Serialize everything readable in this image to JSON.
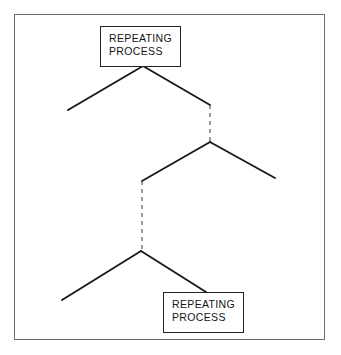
{
  "figure": {
    "type": "zigzag-process-diagram",
    "border_color": "#6e6e6e",
    "line_color": "#1a1a1a",
    "background": "#ffffff"
  },
  "boxes": [
    {
      "id": "top",
      "name": "repeating-process-top",
      "line1": "REPEATING",
      "line2": "PROCESS"
    },
    {
      "id": "bottom",
      "name": "repeating-process-bottom",
      "line1": "REPEATING",
      "line2": "PROCESS"
    }
  ],
  "segments": {
    "solid": [
      {
        "name": "top-left-branch",
        "x1": 143,
        "y1": 66,
        "x2": 68,
        "y2": 110
      },
      {
        "name": "top-right-branch",
        "x1": 143,
        "y1": 66,
        "x2": 210,
        "y2": 105
      },
      {
        "name": "middle-left-branch",
        "x1": 210,
        "y1": 142,
        "x2": 142,
        "y2": 181
      },
      {
        "name": "middle-right-branch",
        "x1": 210,
        "y1": 142,
        "x2": 275,
        "y2": 178
      },
      {
        "name": "bottom-left-branch",
        "x1": 141,
        "y1": 251,
        "x2": 62,
        "y2": 300
      },
      {
        "name": "bottom-right-branch",
        "x1": 141,
        "y1": 251,
        "x2": 206,
        "y2": 292
      }
    ],
    "dashed": [
      {
        "name": "upper-dashed-connector",
        "x1": 210,
        "y1": 105,
        "x2": 210,
        "y2": 142
      },
      {
        "name": "lower-dashed-connector",
        "x1": 142,
        "y1": 181,
        "x2": 142,
        "y2": 251
      }
    ]
  }
}
